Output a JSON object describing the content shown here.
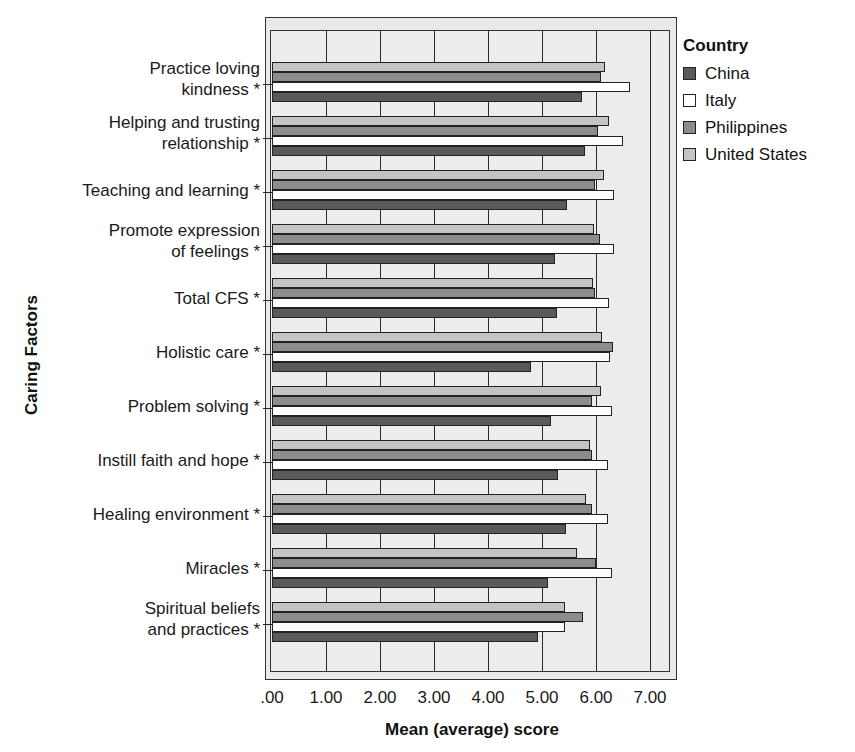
{
  "chart_data": {
    "type": "bar",
    "orientation": "horizontal",
    "title": "",
    "xlabel": "Mean (average) score",
    "ylabel": "Caring Factors",
    "xlim": [
      0,
      7.5
    ],
    "x_ticks": [
      ".00",
      "1.00",
      "2.00",
      "3.00",
      "4.00",
      "5.00",
      "6.00",
      "7.00"
    ],
    "grid": true,
    "legend_title": "Country",
    "legend_position": "right-top",
    "categories": [
      "Practice loving\nkindness *",
      "Helping and trusting\nrelationship *",
      "Teaching and learning *",
      "Promote expression\nof feelings *",
      "Total CFS *",
      "Holistic care *",
      "Problem solving *",
      "Instill faith and hope *",
      "Healing environment *",
      "Miracles *",
      "Spiritual beliefs\nand practices *"
    ],
    "series": [
      {
        "name": "China",
        "color": "#5a5a5a",
        "values": [
          5.74,
          5.8,
          5.46,
          5.24,
          5.28,
          4.8,
          5.17,
          5.3,
          5.44,
          5.11,
          4.93
        ]
      },
      {
        "name": "Italy",
        "color": "#ffffff",
        "values": [
          6.63,
          6.5,
          6.33,
          6.33,
          6.24,
          6.26,
          6.3,
          6.22,
          6.22,
          6.3,
          5.43
        ]
      },
      {
        "name": "Philippines",
        "color": "#8c8c8c",
        "values": [
          6.09,
          6.04,
          5.98,
          6.07,
          5.98,
          6.31,
          5.93,
          5.93,
          5.93,
          6.0,
          5.76
        ]
      },
      {
        "name": "United States",
        "color": "#c4c4c4",
        "values": [
          6.17,
          6.24,
          6.15,
          5.96,
          5.94,
          6.11,
          6.09,
          5.89,
          5.81,
          5.65,
          5.43
        ]
      }
    ]
  },
  "legend": {
    "title": "Country",
    "items": [
      {
        "label": "China",
        "color": "#5a5a5a"
      },
      {
        "label": "Italy",
        "color": "#ffffff"
      },
      {
        "label": "Philippines",
        "color": "#8c8c8c"
      },
      {
        "label": "United States",
        "color": "#c4c4c4"
      }
    ]
  },
  "axes": {
    "xlabel": "Mean (average) score",
    "ylabel": "Caring Factors"
  }
}
